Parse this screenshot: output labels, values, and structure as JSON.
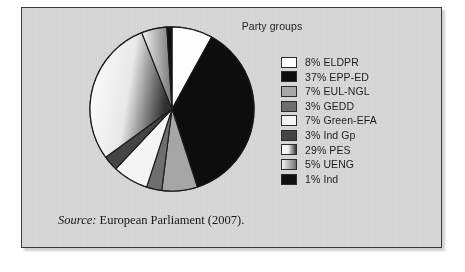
{
  "figure": {
    "title": "Party groups",
    "source_lead": "Source:",
    "source_body": " European Parliament (2007).",
    "panel_bg": "#d9d9d9",
    "border_color": "#3a3a3a"
  },
  "chart_data": {
    "type": "pie",
    "title": "Party groups",
    "xlabel": "",
    "ylabel": "",
    "legend_position": "right",
    "grid": false,
    "categories": [
      "ELDPR",
      "EPP-ED",
      "EUL-NGL",
      "GEDD",
      "Green-EFA",
      "Ind Gp",
      "PES",
      "UENG",
      "Ind"
    ],
    "values": [
      8,
      37,
      7,
      3,
      7,
      3,
      29,
      5,
      1
    ],
    "unit": "%",
    "slices": [
      {
        "label": "ELDPR",
        "value": 8,
        "legend_text": "8% ELDPR",
        "fill": "#fdfdfd",
        "style": "solid"
      },
      {
        "label": "EPP-ED",
        "value": 37,
        "legend_text": "37% EPP-ED",
        "fill": "#0d0d0d",
        "style": "solid"
      },
      {
        "label": "EUL-NGL",
        "value": 7,
        "legend_text": "7% EUL-NGL",
        "fill": "#a6a6a6",
        "style": "solid"
      },
      {
        "label": "GEDD",
        "value": 3,
        "legend_text": "3% GEDD",
        "fill": "#6e6e6e",
        "style": "solid"
      },
      {
        "label": "Green-EFA",
        "value": 7,
        "legend_text": "7% Green-EFA",
        "fill": "#f4f4f4",
        "style": "solid"
      },
      {
        "label": "Ind Gp",
        "value": 3,
        "legend_text": "3% Ind Gp",
        "fill": "#454545",
        "style": "solid"
      },
      {
        "label": "PES",
        "value": 29,
        "legend_text": "29% PES",
        "fill": "#efefef",
        "style": "gradient-white-to-dark"
      },
      {
        "label": "UENG",
        "value": 5,
        "legend_text": "5% UENG",
        "fill": "#bdbdbd",
        "style": "gradient-light-to-dark"
      },
      {
        "label": "Ind",
        "value": 1,
        "legend_text": "1% Ind",
        "fill": "#101010",
        "style": "solid"
      }
    ]
  }
}
